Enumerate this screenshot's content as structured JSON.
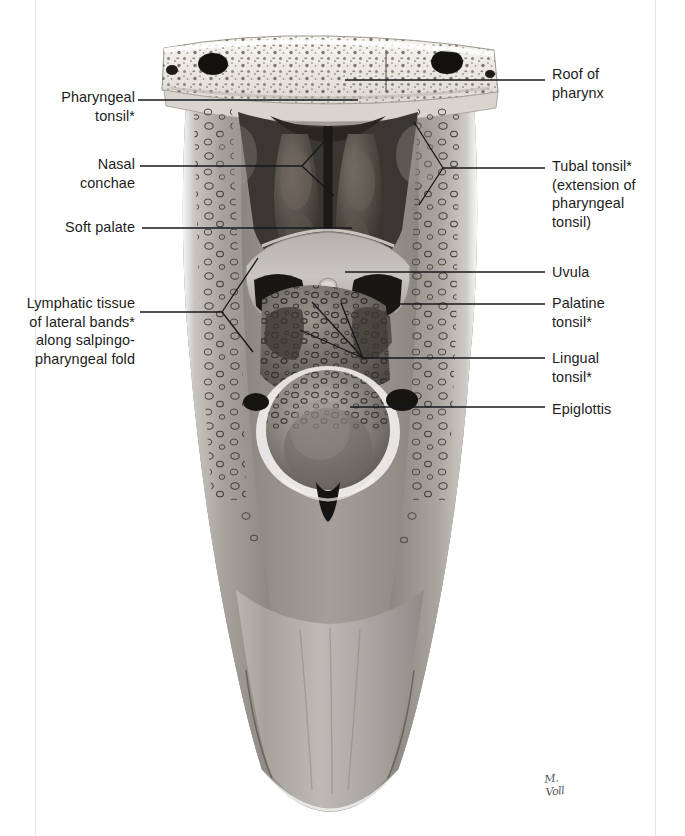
{
  "plate": {
    "figure_type": "anatomical-illustration",
    "subject": "Posterior view of the opened pharynx showing Waldeyer's tonsillar ring",
    "signature": "M. Voll",
    "background_color": "#ffffff",
    "ink_color": "#16181a",
    "page_edge_color": "#e3e3e3"
  },
  "labels_left": [
    {
      "id": "pharyngeal-tonsil",
      "text": "Pharyngeal\ntonsil*",
      "align": "right",
      "x": 30,
      "y": 88,
      "width": 105
    },
    {
      "id": "nasal-conchae",
      "text": "Nasal\nconchae",
      "align": "right",
      "x": 30,
      "y": 155,
      "width": 105
    },
    {
      "id": "soft-palate",
      "text": "Soft palate",
      "align": "right",
      "x": 18,
      "y": 218,
      "width": 117
    },
    {
      "id": "lymphatic-tissue-lateral-bands",
      "text": "Lymphatic tissue\nof lateral bands*\nalong salpingo-\npharyngeal fold",
      "align": "right",
      "x": 10,
      "y": 294,
      "width": 125
    }
  ],
  "labels_right": [
    {
      "id": "roof-of-pharynx",
      "text": "Roof of\npharynx",
      "align": "left",
      "x": 552,
      "y": 65,
      "width": 120
    },
    {
      "id": "tubal-tonsil",
      "text": "Tubal tonsil*\n(extension of\npharyngeal\ntonsil)",
      "align": "left",
      "x": 552,
      "y": 157,
      "width": 126
    },
    {
      "id": "uvula",
      "text": "Uvula",
      "align": "left",
      "x": 552,
      "y": 263,
      "width": 120
    },
    {
      "id": "palatine-tonsil",
      "text": "Palatine\ntonsil*",
      "align": "left",
      "x": 552,
      "y": 294,
      "width": 120
    },
    {
      "id": "lingual-tonsil",
      "text": "Lingual\ntonsil*",
      "align": "left",
      "x": 552,
      "y": 349,
      "width": 120
    },
    {
      "id": "epiglottis",
      "text": "Epiglottis",
      "align": "left",
      "x": 552,
      "y": 400,
      "width": 120
    }
  ],
  "structures": [
    "skull base with cancellous bone and foramina",
    "nasopharynx",
    "nasal conchae",
    "pharyngeal tonsil (adenoid)",
    "tubal tonsil",
    "soft palate",
    "uvula",
    "palatine tonsil",
    "lingual tonsil",
    "epiglottis",
    "lymphatic tissue of lateral bands",
    "posterior pharyngeal wall",
    "esophageal inlet"
  ]
}
